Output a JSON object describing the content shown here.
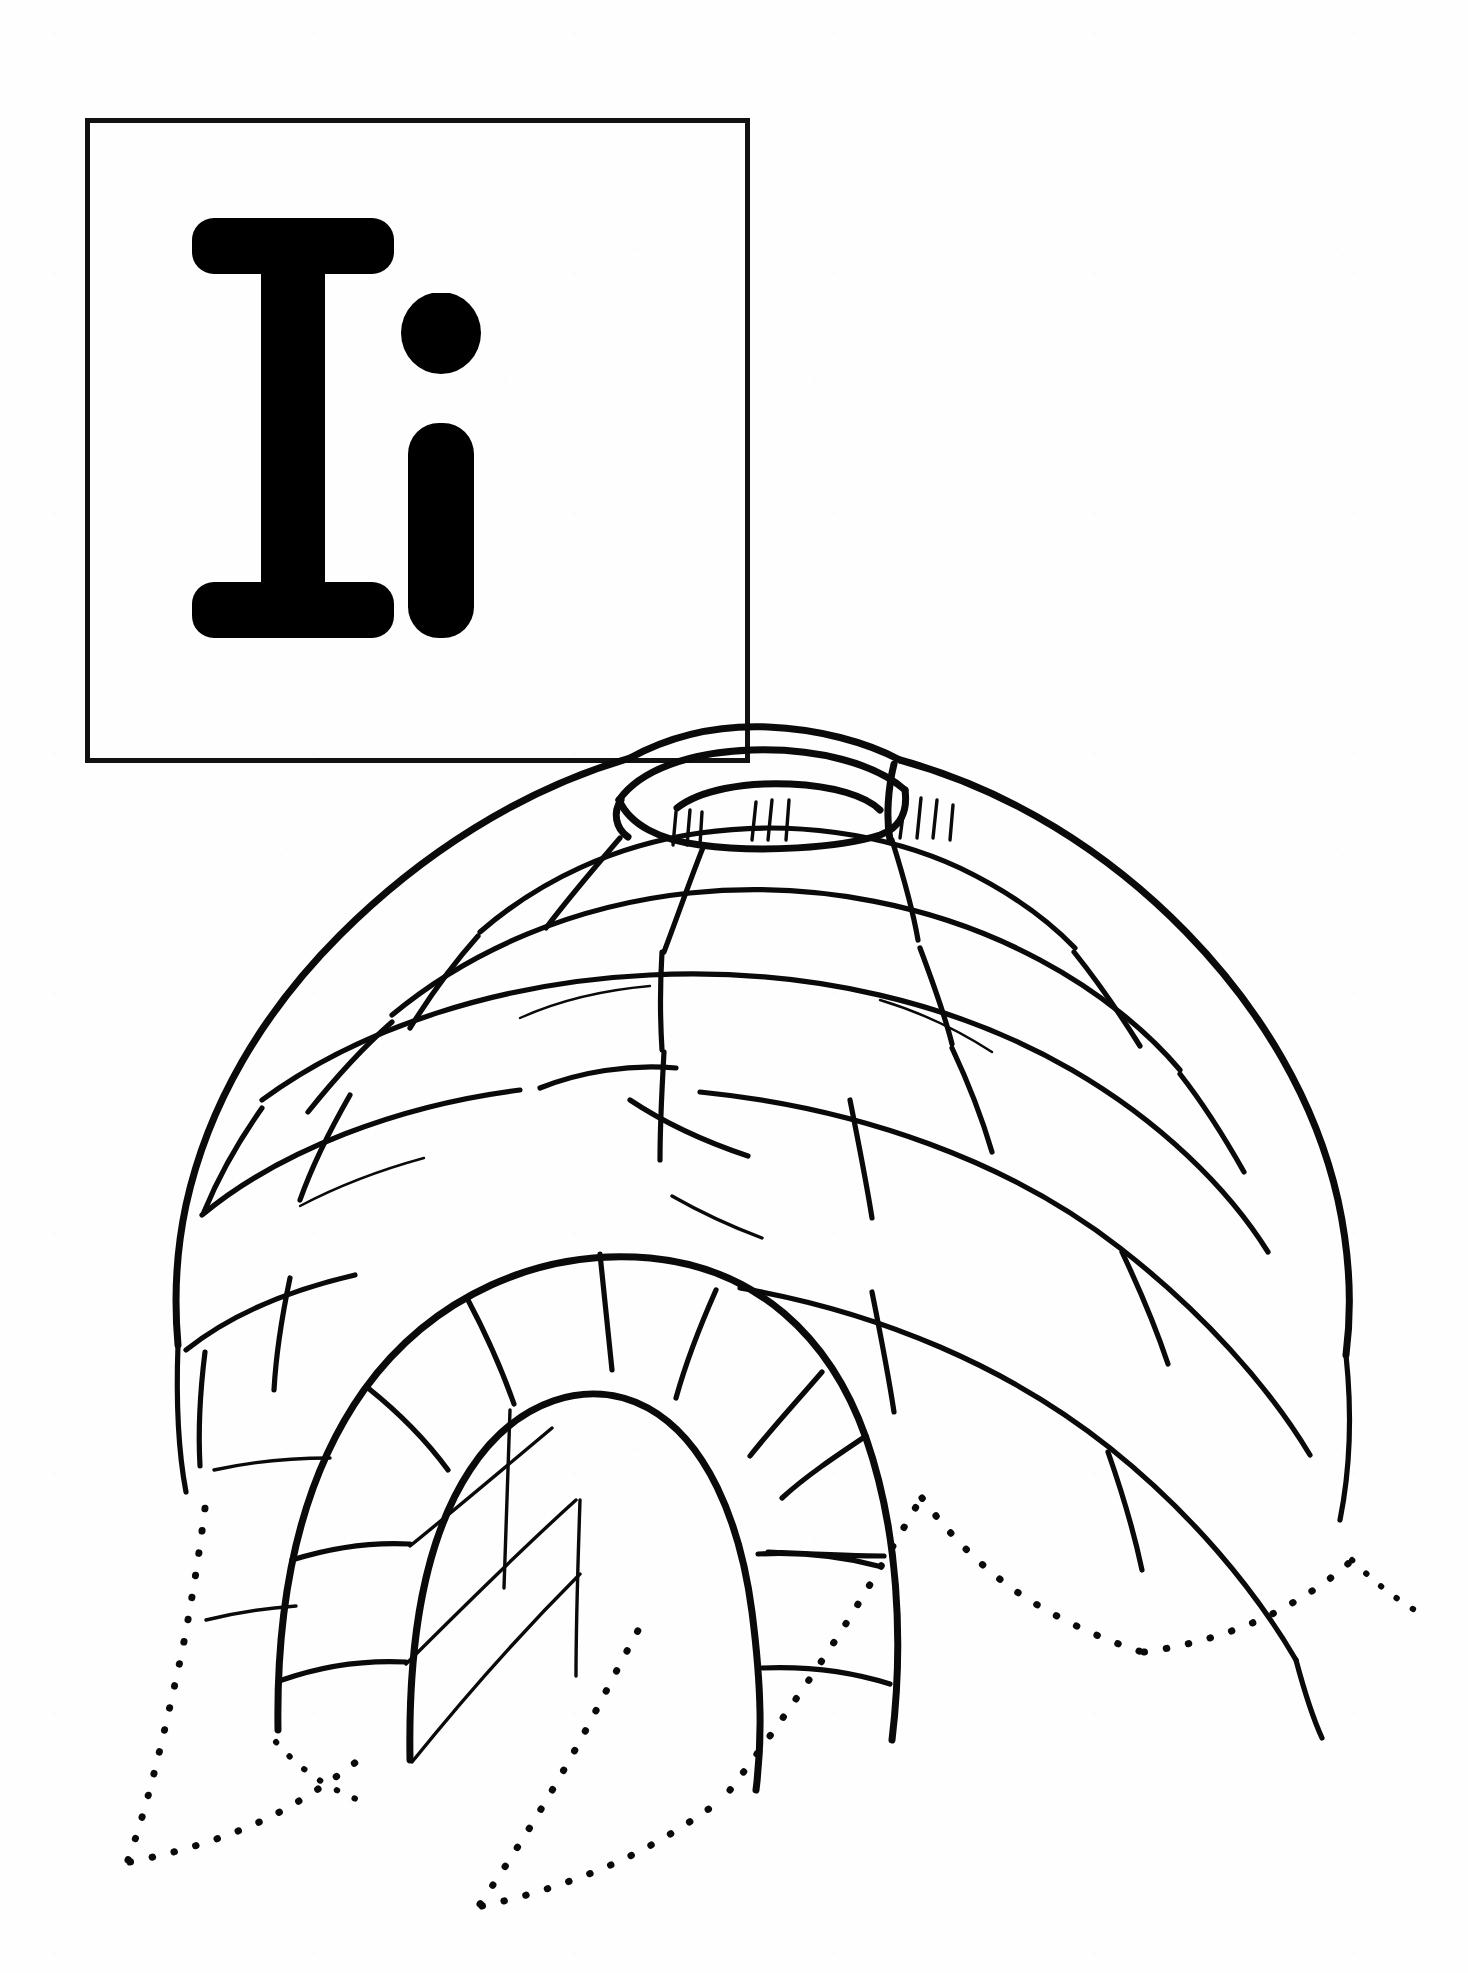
{
  "page": {
    "background_color": "#ffffff",
    "ink_color": "#0a0a0a",
    "width": 1468,
    "height": 1973,
    "style": "black and white line art / coloring page"
  },
  "letter_card": {
    "name": "letter-box",
    "border_color": "#111111",
    "border_width": 5,
    "uppercase": "I",
    "lowercase": "i",
    "letters_combined": "I i"
  },
  "illustration": {
    "name": "igloo-illustration",
    "subject": "igloo",
    "description": "Hand drawn outline of a domed snow-block igloo with an arched entrance tunnel, a ring of blocks around a top smoke hole, and dotted snow drifts along the ground.",
    "parts": [
      {
        "name": "dome",
        "label": "dome"
      },
      {
        "name": "smoke-hole",
        "label": "smoke hole"
      },
      {
        "name": "entrance-tunnel",
        "label": "entrance tunnel"
      },
      {
        "name": "snow-blocks",
        "label": "snow blocks"
      },
      {
        "name": "snow-drift",
        "label": "snow drift"
      }
    ]
  }
}
